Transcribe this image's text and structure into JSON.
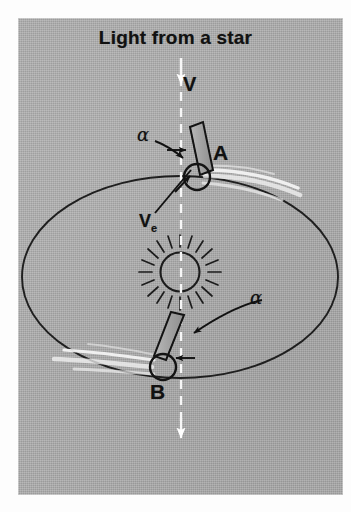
{
  "figure": {
    "title": "Light from a star",
    "background_color": "#a9a9a9",
    "ink_color": "#1a1a1a",
    "highlight_color": "#ffffff",
    "panel": {
      "x": 18,
      "y": 18,
      "width": 325,
      "height": 477
    }
  },
  "labels": {
    "starlight_direction": "V",
    "position_a": "A",
    "position_b": "B",
    "earth_velocity": "V",
    "earth_velocity_subscript": "e",
    "aberration_angle_a": "α",
    "aberration_angle_b": "α"
  },
  "diagram_elements": {
    "orbit": {
      "name": "earth-orbit-ellipse",
      "center_x": 180,
      "center_y": 277,
      "radius_x": 158,
      "radius_y": 101
    },
    "sun": {
      "name": "sun",
      "center_x": 180,
      "center_y": 272,
      "radius": 20,
      "ray_count": 20
    },
    "starlight_ray": {
      "name": "starlight-dashed-ray",
      "x": 181,
      "y_start": 58,
      "y_end": 448,
      "style": "dashed",
      "color": "#ffffff",
      "arrowheads": [
        "top",
        "bottom"
      ]
    },
    "earth_at_a": {
      "name": "earth-a",
      "center_x": 197,
      "center_y": 177,
      "radius": 13
    },
    "earth_at_b": {
      "name": "earth-b",
      "center_x": 163,
      "center_y": 367,
      "radius": 13
    },
    "telescope_a": {
      "name": "telescope-a",
      "tilt_deg": 14,
      "length": 55,
      "width": 13
    },
    "telescope_b": {
      "name": "telescope-b",
      "tilt_deg": -20,
      "length": 55,
      "width": 13
    },
    "motion_streaks_a": {
      "name": "motion-streaks-a",
      "direction": "right"
    },
    "motion_streaks_b": {
      "name": "motion-streaks-b",
      "direction": "left"
    }
  }
}
